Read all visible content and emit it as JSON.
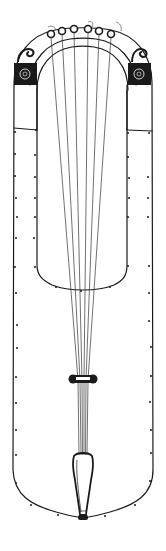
{
  "figure": {
    "subject": "crwth line drawing",
    "colors": {
      "background": "#ffffff",
      "ink": "#1a1a1a",
      "strings": "#333333"
    },
    "parts": {
      "yoke": "yoke-arch",
      "pegs_count": 6,
      "strings_count": 6,
      "scrolls": [
        "left-scroll-ornament",
        "right-scroll-ornament"
      ],
      "bridge": "bridge",
      "tailpiece": "tailpiece",
      "end_button": "end-button"
    }
  }
}
